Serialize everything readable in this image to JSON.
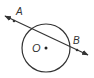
{
  "diagram": {
    "type": "geometry",
    "colors": {
      "stroke": "#333333",
      "background": "#ffffff"
    },
    "circle": {
      "center_label": "O",
      "cx": 46,
      "cy": 48,
      "r": 24
    },
    "line": {
      "type": "line-with-arrows-both-ends",
      "x1": 5,
      "y1": 16,
      "x2": 88,
      "y2": 55
    },
    "points": [
      {
        "label": "A",
        "x": 14,
        "y": 21,
        "label_x": 16,
        "label_y": 15
      },
      {
        "label": "B",
        "x": 77,
        "y": 50,
        "label_x": 73,
        "label_y": 44
      }
    ]
  }
}
